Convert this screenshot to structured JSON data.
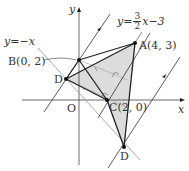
{
  "diagram": {
    "type": "coordinate-geometry",
    "axes": {
      "x_label": "x",
      "y_label": "y",
      "origin_label": "O"
    },
    "points": {
      "A": {
        "label": "A(4, 3)",
        "x": 4,
        "y": 3
      },
      "B": {
        "label": "B(0, 2)",
        "x": 0,
        "y": 2
      },
      "C": {
        "label": "C(2, 0)",
        "x": 2,
        "y": 0
      },
      "D1": {
        "label": "D"
      },
      "D2": {
        "label": "D"
      }
    },
    "lines": {
      "line1": {
        "equation_prefix": "y=",
        "equation_suffix": "x−3",
        "num": "3",
        "den": "2"
      },
      "line2": {
        "equation": "y=−x"
      }
    },
    "colors": {
      "shade": "#d9d9d9",
      "line": "#333333",
      "gray_line": "#9a9a9a"
    }
  }
}
